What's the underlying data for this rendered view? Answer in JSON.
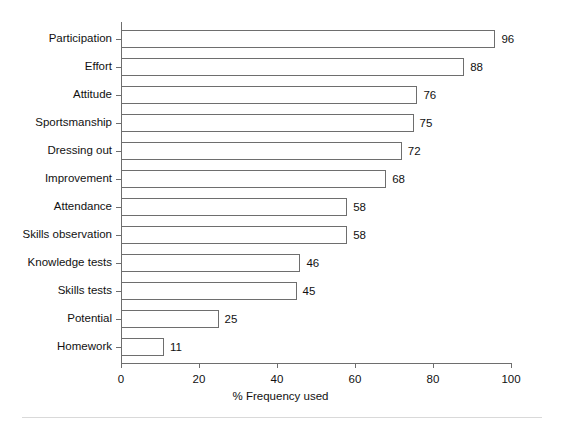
{
  "chart_data": {
    "type": "bar",
    "orientation": "horizontal",
    "title": "",
    "xlabel": "% Frequency used",
    "ylabel": "",
    "xlim": [
      0,
      100
    ],
    "xticks": [
      0,
      20,
      40,
      60,
      80,
      100
    ],
    "grid": false,
    "legend": null,
    "categories": [
      "Participation",
      "Effort",
      "Attitude",
      "Sportsmanship",
      "Dressing out",
      "Improvement",
      "Attendance",
      "Skills observation",
      "Knowledge tests",
      "Skills tests",
      "Potential",
      "Homework"
    ],
    "values": [
      96,
      88,
      76,
      75,
      72,
      68,
      58,
      58,
      46,
      45,
      25,
      11
    ],
    "data_labels": [
      "96",
      "88",
      "76",
      "75",
      "72",
      "68",
      "58",
      "58",
      "46",
      "45",
      "25",
      "11"
    ],
    "colors": {
      "bar_fill": "#ffffff",
      "bar_stroke": "#6e6e6e",
      "axis": "#6e6e6e",
      "text": "#111111",
      "background": "#ffffff"
    }
  },
  "axis": {
    "x_tick_labels": [
      "0",
      "20",
      "40",
      "60",
      "80",
      "100"
    ],
    "x_title": "% Frequency used"
  }
}
